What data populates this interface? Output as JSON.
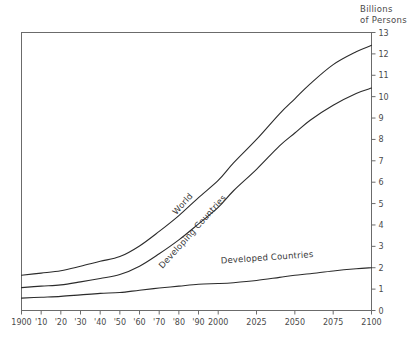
{
  "chart_data": {
    "type": "line",
    "title": "",
    "ylabel": "Billions of Persons",
    "ylabel_line1": "Billions",
    "ylabel_line2": "of Persons",
    "xlabel": "",
    "xlim": [
      1900,
      2100
    ],
    "ylim": [
      0,
      13
    ],
    "grid": false,
    "legend": "inline-curve-labels",
    "yticks": [
      0,
      1,
      2,
      3,
      4,
      5,
      6,
      7,
      8,
      9,
      10,
      11,
      12,
      13
    ],
    "ytick_labels": [
      "0",
      "1",
      "2",
      "3",
      "4",
      "5",
      "6",
      "7",
      "8",
      "9",
      "10",
      "11",
      "12",
      "13"
    ],
    "ytick_side": "right",
    "xticks": [
      1900,
      1910,
      1920,
      1930,
      1940,
      1950,
      1960,
      1970,
      1980,
      1990,
      2000,
      2025,
      2050,
      2075,
      2100
    ],
    "xtick_labels": [
      "1900",
      "'10",
      "'20",
      "'30",
      "'40",
      "'50",
      "'60",
      "'70",
      "'80",
      "'90",
      "2000",
      "2025",
      "2050",
      "2075",
      "2100"
    ],
    "x": [
      1900,
      1910,
      1920,
      1930,
      1940,
      1950,
      1960,
      1970,
      1980,
      1990,
      2000,
      2010,
      2025,
      2040,
      2050,
      2060,
      2075,
      2090,
      2100
    ],
    "series": [
      {
        "name": "World",
        "label": "World",
        "color": "#2b2b2b",
        "values": [
          1.65,
          1.75,
          1.86,
          2.07,
          2.3,
          2.52,
          3.02,
          3.7,
          4.44,
          5.28,
          6.08,
          6.9,
          8.0,
          9.2,
          9.9,
          10.6,
          11.5,
          12.1,
          12.4
        ]
      },
      {
        "name": "Developing Countries",
        "label": "Developing Countries",
        "color": "#2b2b2b",
        "values": [
          1.07,
          1.14,
          1.2,
          1.34,
          1.5,
          1.68,
          2.07,
          2.65,
          3.3,
          4.05,
          4.82,
          5.6,
          6.6,
          7.7,
          8.3,
          8.9,
          9.6,
          10.15,
          10.4
        ]
      },
      {
        "name": "Developed Countries",
        "label": "Developed Countries",
        "color": "#2b2b2b",
        "values": [
          0.58,
          0.62,
          0.66,
          0.73,
          0.8,
          0.84,
          0.95,
          1.05,
          1.14,
          1.23,
          1.26,
          1.3,
          1.4,
          1.55,
          1.65,
          1.72,
          1.85,
          1.95,
          2.0
        ]
      }
    ],
    "annotations": [
      {
        "text": "World",
        "at_x": 1983,
        "at_y": 4.9,
        "rotation": -48
      },
      {
        "text": "Developing Countries",
        "at_x": 1988,
        "at_y": 3.6,
        "rotation": -48
      },
      {
        "text": "Developed Countries",
        "at_x": 2032,
        "at_y": 2.35,
        "rotation": -4
      }
    ]
  }
}
